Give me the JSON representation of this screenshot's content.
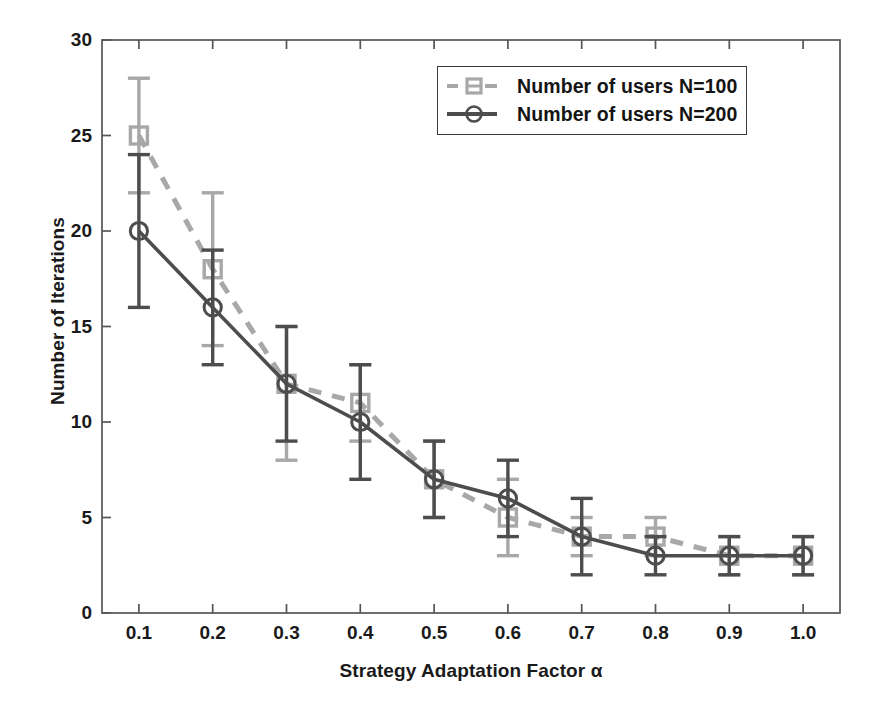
{
  "chart_data": {
    "type": "line",
    "title": "",
    "xlabel": "Strategy Adaptation Factor α",
    "ylabel": "Number of Iterations",
    "x": [
      0.1,
      0.2,
      0.3,
      0.4,
      0.5,
      0.6,
      0.7,
      0.8,
      0.9,
      1.0
    ],
    "xticklabels": [
      "0.1",
      "0.2",
      "0.3",
      "0.4",
      "0.5",
      "0.6",
      "0.7",
      "0.8",
      "0.9",
      "1.0"
    ],
    "yticklabels": [
      "0",
      "5",
      "10",
      "15",
      "20",
      "25",
      "30"
    ],
    "yticks": [
      0,
      5,
      10,
      15,
      20,
      25,
      30
    ],
    "xlim": [
      0.05,
      1.05
    ],
    "ylim": [
      0,
      30
    ],
    "grid": false,
    "legend_position": "upper right",
    "series": [
      {
        "name": "Number of users N=100",
        "values": [
          25,
          18,
          12,
          11,
          7,
          5,
          4,
          4,
          3,
          3
        ],
        "err_low": [
          22,
          14,
          8,
          9,
          5,
          3,
          3,
          3,
          2,
          2
        ],
        "err_high": [
          28,
          22,
          15,
          13,
          9,
          7,
          5,
          5,
          4,
          4
        ],
        "color": "#a8a8a8",
        "linestyle": "dashed",
        "marker": "square"
      },
      {
        "name": "Number of users N=200",
        "values": [
          20,
          16,
          12,
          10,
          7,
          6,
          4,
          3,
          3,
          3
        ],
        "err_low": [
          16,
          13,
          9,
          7,
          5,
          4,
          2,
          2,
          2,
          2
        ],
        "err_high": [
          24,
          19,
          15,
          13,
          9,
          8,
          6,
          4,
          4,
          4
        ],
        "color": "#4d4d4d",
        "linestyle": "solid",
        "marker": "circle"
      }
    ]
  },
  "legend": {
    "items": [
      {
        "label": "Number of users N=100"
      },
      {
        "label": "Number of users N=200"
      }
    ]
  },
  "axes": {
    "box_color": "#555555"
  }
}
